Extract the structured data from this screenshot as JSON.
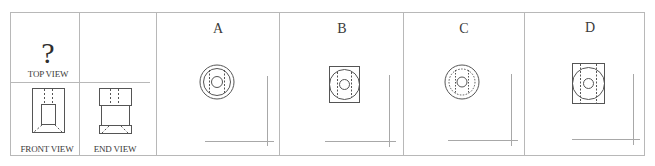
{
  "question": {
    "mark": "?",
    "top_view_label": "TOP VIEW",
    "front_view_label": "FRONT VIEW",
    "end_view_label": "END VIEW"
  },
  "options": [
    {
      "letter": "A",
      "description": "two concentric circles, dashed vertical lines, small inner circle"
    },
    {
      "letter": "B",
      "description": "square outline with circle, dashed vertical lines, small inner circle"
    },
    {
      "letter": "C",
      "description": "solid outer circle, dotted inner circle, small inner circle"
    },
    {
      "letter": "D",
      "description": "rectangle outline with circle, dashed vertical lines, small inner circle"
    }
  ],
  "colors": {
    "line": "#555555",
    "grid": "#b5b5b5",
    "axis": "#a8a8a8",
    "background": "#ffffff"
  }
}
